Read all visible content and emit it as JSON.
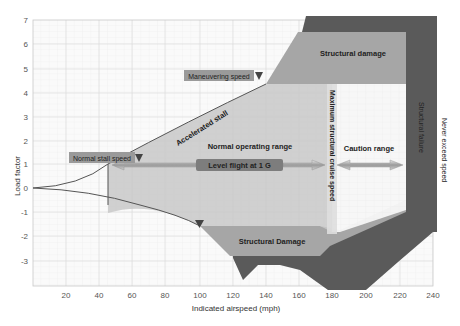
{
  "diagram": {
    "xaxis": {
      "label": "Indicated airspeed (mph)",
      "ticks": [
        "20",
        "40",
        "60",
        "80",
        "100",
        "120",
        "140",
        "160",
        "180",
        "200",
        "220",
        "240"
      ]
    },
    "yaxis": {
      "label": "Load factor",
      "ticks": [
        "7",
        "6",
        "5",
        "4",
        "3",
        "2",
        "1",
        "0",
        "-1",
        "-2",
        "-3"
      ]
    },
    "regions": {
      "structural_damage_top": "Structural damage",
      "structural_damage_bottom": "Structural Damage",
      "normal_operating": "Normal operating range",
      "caution": "Caution range",
      "structural_failure": "Structural failure",
      "never_exceed": "Never exceed speed"
    },
    "labels": {
      "accelerated_stall": "Accelerated stall",
      "maneuvering_speed": "Maneuvering speed",
      "normal_stall_speed": "Normal stall speed",
      "level_flight": "Level flight at 1 G",
      "max_structural_cruise": "Maximum structural cruise speed"
    },
    "colors": {
      "normal_range": "#c9c9c9",
      "damage": "#a8a8a8",
      "failure": "#5a5a5a",
      "label_box": "#9a9a9a",
      "level_box": "#7d7d7d",
      "grid": "#e0e0e0"
    }
  }
}
